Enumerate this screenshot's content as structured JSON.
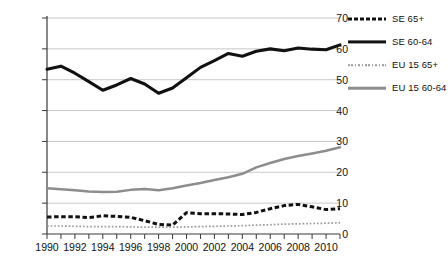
{
  "chart_data": {
    "type": "line",
    "title": "",
    "subtitle": "",
    "xlabel": "",
    "ylabel": "",
    "xlim": [
      1990,
      2011
    ],
    "ylim": [
      0,
      70
    ],
    "yticks": [
      0,
      10,
      20,
      30,
      40,
      50,
      60,
      70
    ],
    "ytick_labels": [
      "0",
      "10",
      "20",
      "30",
      "40",
      "50",
      "60",
      "70"
    ],
    "x": [
      1990,
      1991,
      1992,
      1993,
      1994,
      1995,
      1996,
      1997,
      1998,
      1999,
      2000,
      2001,
      2002,
      2003,
      2004,
      2005,
      2006,
      2007,
      2008,
      2009,
      2010,
      2011
    ],
    "xtick_labels": [
      "1990",
      "1992",
      "1994",
      "1996",
      "1998",
      "2000",
      "2002",
      "2004",
      "2006",
      "2008",
      "2010"
    ],
    "xtick_label_values": [
      1990,
      1992,
      1994,
      1996,
      1998,
      2000,
      2002,
      2004,
      2006,
      2008,
      2010
    ],
    "grid": "horizontal",
    "legend_position": "right",
    "series": [
      {
        "name": "SE 65+",
        "style": "dashed",
        "color": "#111111",
        "values": [
          5.5,
          5.6,
          5.6,
          5.3,
          5.9,
          5.7,
          5.4,
          4.3,
          3.1,
          2.9,
          6.9,
          6.6,
          6.6,
          6.5,
          6.3,
          7.0,
          8.2,
          9.2,
          9.6,
          8.8,
          7.9,
          8.2
        ]
      },
      {
        "name": "SE 60-64",
        "style": "solid-thick",
        "color": "#111111",
        "values": [
          53.4,
          54.4,
          52.1,
          49.4,
          46.6,
          48.3,
          50.4,
          48.6,
          45.6,
          47.3,
          50.6,
          54.0,
          56.2,
          58.5,
          57.6,
          59.2,
          60.0,
          59.4,
          60.3,
          59.9,
          59.7,
          61.3
        ]
      },
      {
        "name": "EU 15 65+",
        "style": "dotted",
        "color": "#9a9a9a",
        "values": [
          2.6,
          2.6,
          2.5,
          2.4,
          2.4,
          2.4,
          2.3,
          2.2,
          2.2,
          2.2,
          2.3,
          2.4,
          2.5,
          2.6,
          2.7,
          2.9,
          3.0,
          3.2,
          3.3,
          3.4,
          3.5,
          3.6
        ]
      },
      {
        "name": "EU 15 60-64",
        "style": "solid",
        "color": "#8d8d8d",
        "values": [
          14.8,
          14.5,
          14.2,
          13.8,
          13.6,
          13.7,
          14.3,
          14.6,
          14.2,
          14.8,
          15.7,
          16.5,
          17.5,
          18.4,
          19.5,
          21.6,
          23.0,
          24.3,
          25.3,
          26.1,
          27.0,
          28.1
        ]
      }
    ]
  },
  "legend": {
    "items": [
      {
        "label": "SE 65+",
        "style": "dashed"
      },
      {
        "label": "SE 60-64",
        "style": "solid-thick"
      },
      {
        "label": "EU 15 65+",
        "style": "dotted"
      },
      {
        "label": "EU 15 60-64",
        "style": "solid"
      }
    ]
  },
  "axis": {
    "y_labels": [
      "70",
      "60",
      "50",
      "40",
      "30",
      "20",
      "10",
      "0"
    ],
    "x_labels": [
      "1990",
      "1992",
      "1994",
      "1996",
      "1998",
      "2000",
      "2002",
      "2004",
      "2006",
      "2008",
      "2010"
    ]
  },
  "colors": {
    "se": "#111111",
    "eu": "#8d8d8d",
    "grid": "#c8c8c8",
    "axis": "#3a3a3a",
    "background": "#ffffff"
  }
}
